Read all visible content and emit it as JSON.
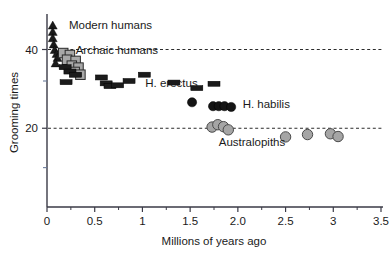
{
  "chart_data": {
    "type": "scatter",
    "title": "",
    "xlabel": "Millions of years ago",
    "ylabel": "Grooming times",
    "xlim": [
      0,
      3.5
    ],
    "ylim": [
      0,
      48
    ],
    "grid": "horizontal-dashed",
    "gridlines_y": [
      40,
      20
    ],
    "legend": "inline-annotations",
    "xticks": [
      0,
      0.5,
      1,
      1.5,
      2.0,
      2.5,
      3,
      3.5
    ],
    "xticklabels": [
      "0",
      "0.5",
      "1",
      "1.5",
      "2.0",
      "2.5",
      "3",
      "3.5"
    ],
    "xminor_ticks": [
      0.25,
      0.75,
      1.25,
      1.75,
      2.25,
      2.75,
      3.25
    ],
    "yticks": [
      40,
      20
    ],
    "yticklabels": [
      "40",
      "20"
    ],
    "yminor_ticks": [
      32,
      10
    ],
    "series": [
      {
        "name": "Modern humans",
        "marker": "triangle",
        "color": "#1b1b1b",
        "points": [
          {
            "x": 0.06,
            "y": 46.2
          },
          {
            "x": 0.06,
            "y": 44.6
          },
          {
            "x": 0.06,
            "y": 43.0
          },
          {
            "x": 0.07,
            "y": 41.4
          },
          {
            "x": 0.08,
            "y": 40.0
          },
          {
            "x": 0.1,
            "y": 39.0
          },
          {
            "x": 0.11,
            "y": 38.0
          },
          {
            "x": 0.09,
            "y": 36.6
          }
        ]
      },
      {
        "name": "Archaic humans",
        "marker": "square",
        "color": "#a8a8a8",
        "points": [
          {
            "x": 0.17,
            "y": 39.1
          },
          {
            "x": 0.24,
            "y": 38.6
          },
          {
            "x": 0.21,
            "y": 37.4
          },
          {
            "x": 0.3,
            "y": 37.1
          },
          {
            "x": 0.26,
            "y": 35.9
          },
          {
            "x": 0.33,
            "y": 35.4
          },
          {
            "x": 0.29,
            "y": 34.3
          },
          {
            "x": 0.35,
            "y": 33.6
          }
        ]
      },
      {
        "name": "H. erectus",
        "marker": "rect",
        "color": "#1b1b1b",
        "points": [
          {
            "x": 0.19,
            "y": 35.5
          },
          {
            "x": 0.24,
            "y": 34.4
          },
          {
            "x": 0.3,
            "y": 33.6
          },
          {
            "x": 0.2,
            "y": 31.7
          },
          {
            "x": 0.57,
            "y": 32.9
          },
          {
            "x": 0.62,
            "y": 31.4
          },
          {
            "x": 0.66,
            "y": 30.7
          },
          {
            "x": 0.74,
            "y": 30.9
          },
          {
            "x": 0.86,
            "y": 32.0
          },
          {
            "x": 1.02,
            "y": 33.6
          },
          {
            "x": 1.33,
            "y": 31.6
          },
          {
            "x": 1.57,
            "y": 30.2
          },
          {
            "x": 1.75,
            "y": 31.3
          }
        ]
      },
      {
        "name": "H. habilis",
        "marker": "circle",
        "color": "#141414",
        "points": [
          {
            "x": 1.52,
            "y": 26.6
          },
          {
            "x": 1.74,
            "y": 25.6
          },
          {
            "x": 1.8,
            "y": 25.6
          },
          {
            "x": 1.86,
            "y": 25.6
          },
          {
            "x": 1.93,
            "y": 25.4
          }
        ]
      },
      {
        "name": "Australopiths",
        "marker": "circle",
        "color": "#a5a5a5",
        "points": [
          {
            "x": 1.73,
            "y": 20.3
          },
          {
            "x": 1.79,
            "y": 20.9
          },
          {
            "x": 1.85,
            "y": 20.4
          },
          {
            "x": 1.9,
            "y": 19.6
          },
          {
            "x": 2.5,
            "y": 17.8
          },
          {
            "x": 2.73,
            "y": 18.4
          },
          {
            "x": 2.97,
            "y": 18.6
          },
          {
            "x": 3.05,
            "y": 17.9
          }
        ]
      }
    ],
    "annotations": [
      {
        "text": "Modern humans",
        "x": 0.23,
        "y": 45.2
      },
      {
        "text": "Archaic humans",
        "x": 0.3,
        "y": 38.8
      },
      {
        "text": "H. erectus",
        "x": 1.03,
        "y": 30.4
      },
      {
        "text": "H. habilis",
        "x": 2.05,
        "y": 25.1
      },
      {
        "text": "Australopiths",
        "x": 1.8,
        "y": 15.6
      }
    ]
  }
}
